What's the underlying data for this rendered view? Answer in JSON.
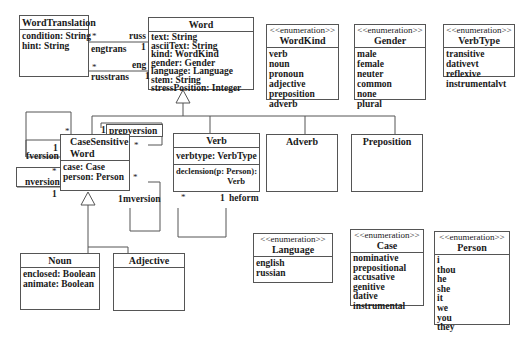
{
  "classes": {
    "word_translation": {
      "name": "WordTranslation",
      "attributes": [
        "condition: String",
        "hint: String"
      ]
    },
    "word": {
      "name": "Word",
      "attributes": [
        "text: String",
        "asciiText: String",
        "kind: WordKind",
        "gender: Gender",
        "language: Language",
        "stem: String",
        "stressPosition: Integer"
      ]
    },
    "case_sensitive_word": {
      "name_line1": "CaseSensitive",
      "name_line2": "Word",
      "attributes": [
        "case: Case",
        "person: Person"
      ]
    },
    "verb": {
      "name": "Verb",
      "attributes": [
        "verbtype: VerbType"
      ],
      "operations_line1": "declension(p: Person):",
      "operations_line2": "Verb"
    },
    "adverb": {
      "name": "Adverb"
    },
    "preposition": {
      "name": "Preposition"
    },
    "noun": {
      "name": "Noun",
      "attributes": [
        "enclosed: Boolean",
        "animate: Boolean"
      ]
    },
    "adjective": {
      "name": "Adjective"
    }
  },
  "enumerations": {
    "stereotype": "<<enumeration>>",
    "word_kind": {
      "name": "WordKind",
      "values": [
        "verb",
        "noun",
        "pronoun",
        "adjective",
        "preposition",
        "adverb"
      ]
    },
    "gender": {
      "name": "Gender",
      "values": [
        "male",
        "female",
        "neuter",
        "common",
        "none",
        "plural"
      ]
    },
    "verb_type": {
      "name": "VerbType",
      "values": [
        "transitive",
        "dativevt",
        "reflexive",
        "instrumentalvt"
      ]
    },
    "language": {
      "name": "Language",
      "values": [
        "english",
        "russian"
      ]
    },
    "case": {
      "name": "Case",
      "values": [
        "nominative",
        "prepositional",
        "accusative",
        "genitive",
        "dative",
        "instrumental"
      ]
    },
    "person": {
      "name": "Person",
      "values": [
        "i",
        "thou",
        "he",
        "she",
        "it",
        "we",
        "you",
        "they"
      ]
    }
  },
  "associations": {
    "engtrans": {
      "label": "engtrans",
      "role_end": "russ",
      "mult_source": "*",
      "mult_target": "1"
    },
    "russtrans": {
      "label": "russtrans",
      "role_end": "eng",
      "mult_source": "*",
      "mult_target": "1"
    },
    "fversion": {
      "label": "fversion",
      "mult_many": "*",
      "mult_one": "1"
    },
    "nversion": {
      "label": "nversion",
      "mult_many": "*",
      "mult_one": "1"
    },
    "prepversion": {
      "label": "prepversion",
      "mult_one": "1",
      "mult_many": "*"
    },
    "mversion": {
      "label": "mversion",
      "mult_one": "1",
      "mult_many": "*"
    },
    "heform": {
      "label": "heform",
      "mult_many": "*",
      "mult_one": "1"
    }
  }
}
